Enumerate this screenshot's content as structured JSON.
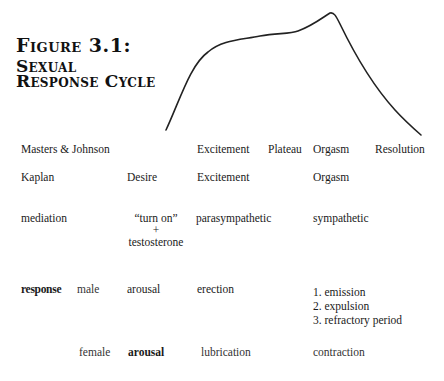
{
  "figure": {
    "title_line1": "Figure 3.1:",
    "title_line2": "Sexual",
    "title_line3": "Response Cycle"
  },
  "curve": {
    "description": "Response intensity curve: rapid rise (excitement), plateau, peak (orgasm), decline (resolution)",
    "stroke": "#222222"
  },
  "rows": {
    "masters_johnson": {
      "label": "Masters & Johnson",
      "phases": [
        "Excitement",
        "Plateau",
        "Orgasm",
        "Resolution"
      ]
    },
    "kaplan": {
      "label": "Kaplan",
      "phases": [
        "Desire",
        "Excitement",
        "Orgasm"
      ]
    },
    "mediation": {
      "label": "mediation",
      "desire_line1": "“turn on”",
      "desire_plus": "+",
      "desire_line2": "testosterone",
      "excitement": "parasympathetic",
      "orgasm": "sympathetic"
    },
    "response_male": {
      "label": "response",
      "sex": "male",
      "desire": "arousal",
      "excitement": "erection",
      "orgasm": [
        "1. emission",
        "2. expulsion",
        "3. refractory period"
      ]
    },
    "response_female": {
      "sex": "female",
      "desire": "arousal",
      "excitement": "lubrication",
      "orgasm": "contraction"
    }
  }
}
